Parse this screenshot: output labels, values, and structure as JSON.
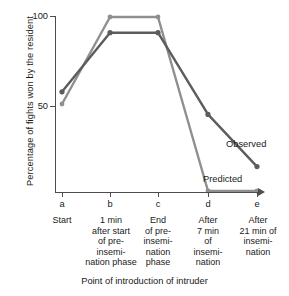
{
  "chart_data": {
    "type": "line",
    "title": "",
    "xlabel": "Point of introduction of intruder",
    "ylabel": "Percentage of fights won by the resident",
    "categories": [
      "a",
      "b",
      "c",
      "d",
      "e"
    ],
    "category_captions": [
      "Start",
      "1 min\nafter start\nof pre-\ninsemi-\nnation phase",
      "End\nof pre-\ninsemi-\nnation\nphase",
      "After\n7 min\nof\ninsemi-\nnation",
      "After\n21 min of\ninsemi-\nnation"
    ],
    "ylim": [
      0,
      105
    ],
    "yticks": [
      50,
      100
    ],
    "ytick_labels": [
      "50",
      "100"
    ],
    "grid": false,
    "legend_position": "inline-at-curve-end",
    "series": [
      {
        "name": "Observed",
        "color": "#5c5c5c",
        "values": [
          57,
          91,
          91,
          44,
          14
        ],
        "markers": true
      },
      {
        "name": "Predicted",
        "color": "#8f8f8f",
        "values": [
          50,
          100,
          100,
          0,
          0
        ],
        "markers": true
      }
    ],
    "annotations": [
      {
        "text": "Observed",
        "series": "Observed"
      },
      {
        "text": "Predicted",
        "series": "Predicted"
      }
    ]
  },
  "axis": {
    "y_title": "Percentage of fights won by the resident",
    "x_title": "Point of introduction of intruder",
    "ytick_100": "100",
    "ytick_50": "50"
  },
  "ticks": {
    "a": "a",
    "b": "b",
    "c": "c",
    "d": "d",
    "e": "e"
  },
  "captions": {
    "a_l1": "Start",
    "b_l1": "1 min",
    "b_l2": "after start",
    "b_l3": "of pre-",
    "b_l4": "insemi-",
    "b_l5": "nation phase",
    "c_l1": "End",
    "c_l2": "of pre-",
    "c_l3": "insemi-",
    "c_l4": "nation",
    "c_l5": "phase",
    "d_l1": "After",
    "d_l2": "7 min",
    "d_l3": "of",
    "d_l4": "insemi-",
    "d_l5": "nation",
    "e_l1": "After",
    "e_l2": "21 min of",
    "e_l3": "insemi-",
    "e_l4": "nation"
  },
  "series_labels": {
    "observed": "Observed",
    "predicted": "Predicted"
  }
}
